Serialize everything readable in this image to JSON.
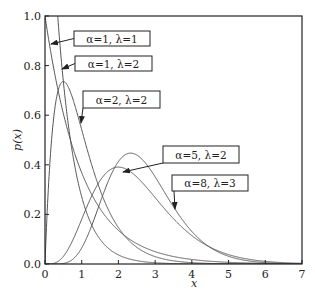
{
  "chart_data": {
    "type": "line",
    "title": "",
    "xlabel": "x",
    "ylabel": "p(x)",
    "xlim": [
      0,
      7
    ],
    "ylim": [
      0,
      1.0
    ],
    "xticks": [
      "0",
      "1",
      "2",
      "3",
      "4",
      "5",
      "6",
      "7"
    ],
    "yticks": [
      "0.0",
      "0.2",
      "0.4",
      "0.6",
      "0.8",
      "1.0"
    ],
    "grid": false,
    "legend": "none (inline annotations with arrows)",
    "function": "Gamma pdf: p(x) = λ^α x^(α-1) e^(-λx) / Γ(α)",
    "series": [
      {
        "name": "α=1, λ=1",
        "alpha": 1,
        "lambda": 1,
        "x": [
          0,
          0.5,
          1,
          2,
          3,
          4,
          5,
          6,
          7
        ],
        "values": [
          1.0,
          0.607,
          0.368,
          0.135,
          0.05,
          0.018,
          0.007,
          0.002,
          0.001
        ]
      },
      {
        "name": "α=1, λ=2",
        "alpha": 1,
        "lambda": 2,
        "x": [
          0,
          0.5,
          1,
          2,
          3,
          4,
          5,
          6,
          7
        ],
        "values": [
          2.0,
          0.736,
          0.271,
          0.037,
          0.005,
          0.001,
          0.0,
          0.0,
          0.0
        ]
      },
      {
        "name": "α=2, λ=2",
        "alpha": 2,
        "lambda": 2,
        "x": [
          0,
          0.5,
          1,
          2,
          3,
          4,
          5,
          6,
          7
        ],
        "values": [
          0.0,
          0.736,
          0.541,
          0.147,
          0.03,
          0.005,
          0.001,
          0.0,
          0.0
        ]
      },
      {
        "name": "α=5, λ=2",
        "alpha": 5,
        "lambda": 2,
        "x": [
          0,
          0.5,
          1,
          2,
          3,
          4,
          5,
          6,
          7
        ],
        "values": [
          0.0,
          0.015,
          0.18,
          0.391,
          0.268,
          0.115,
          0.038,
          0.011,
          0.003
        ]
      },
      {
        "name": "α=8, λ=3",
        "alpha": 8,
        "lambda": 3,
        "x": [
          0,
          0.5,
          1,
          2,
          3,
          4,
          5,
          6,
          7
        ],
        "values": [
          0.0,
          0.001,
          0.065,
          0.402,
          0.281,
          0.093,
          0.02,
          0.003,
          0.0
        ]
      }
    ],
    "annotations": [
      {
        "text": "α=1, λ=1",
        "box": [
          74,
          31,
          76,
          15
        ],
        "arrow_to": [
          51,
          44
        ]
      },
      {
        "text": "α=1, λ=2",
        "box": [
          75,
          56,
          77,
          15
        ],
        "arrow_to": [
          62,
          69
        ]
      },
      {
        "text": "α=2, λ=2",
        "box": [
          83,
          91,
          77,
          17
        ],
        "arrow_to": [
          81,
          123
        ]
      },
      {
        "text": "α=5, λ=2",
        "box": [
          163,
          146,
          76,
          17
        ],
        "arrow_to": [
          123,
          172
        ]
      },
      {
        "text": "α=8, λ=3",
        "box": [
          172,
          175,
          76,
          16
        ],
        "arrow_to": [
          175,
          209
        ]
      }
    ]
  }
}
